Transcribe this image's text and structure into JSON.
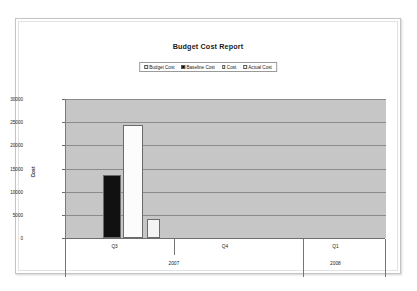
{
  "chart_data": {
    "type": "bar",
    "title": "Budget Cost Report",
    "xlabel": "",
    "ylabel": "Cost",
    "ylim": [
      0,
      30000
    ],
    "ytick_labels": [
      "0",
      "5000",
      "10000",
      "15000",
      "20000",
      "25000",
      "30000"
    ],
    "ytick_values": [
      0,
      5000,
      10000,
      15000,
      20000,
      25000,
      30000
    ],
    "grid": true,
    "legend_position": "top-center",
    "categories": [
      "Q3",
      "Q4",
      "Q1"
    ],
    "group_labels": [
      "2007",
      "2008"
    ],
    "legend": [
      {
        "name": "Budget Cost",
        "color": "#f2f2f2"
      },
      {
        "name": "Baseline Cost",
        "color": "#111111"
      },
      {
        "name": "Cost",
        "color": "#fcfcfc"
      },
      {
        "name": "Actual Cost",
        "color": "#fcfcfc"
      }
    ],
    "series": [
      {
        "name": "Budget Cost",
        "values": [
          24400,
          0,
          0
        ],
        "color": "#fcfcfc"
      },
      {
        "name": "Baseline Cost",
        "values": [
          13500,
          0,
          0
        ],
        "color": "#111111"
      },
      {
        "name": "Cost",
        "values": [
          4200,
          0,
          0
        ],
        "color": "#f4f4f4"
      },
      {
        "name": "Actual Cost",
        "values": [
          0,
          0,
          0
        ],
        "color": "#fcfcfc"
      }
    ],
    "bars": [
      {
        "label": "Baseline Cost",
        "value": 13500,
        "color": "#111111",
        "x_pct": 11.5,
        "width_pct": 5.7
      },
      {
        "label": "Budget Cost",
        "value": 24400,
        "color": "#fcfcfc",
        "x_pct": 17.9,
        "width_pct": 6.3
      },
      {
        "label": "Cost",
        "value": 4200,
        "color": "#f4f4f4",
        "x_pct": 25.3,
        "width_pct": 4.2
      }
    ]
  },
  "axes": {
    "quarter_positions_pct": [
      15.5,
      50.0,
      84.5
    ],
    "quarter_separator_pct": [
      34.0,
      74.5
    ],
    "year_positions_pct": [
      34.0,
      84.5
    ],
    "year_separator_pct": [
      74.5
    ]
  },
  "colors": {
    "plot_background": "#c6c6c6",
    "gridline": "#8b8b8b",
    "axis": "#6e6e6e",
    "text": "#1a1a1a",
    "page": "#ffffff"
  }
}
